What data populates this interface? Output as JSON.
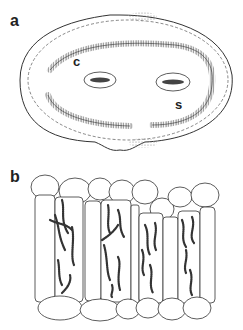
{
  "figure": {
    "panels": [
      {
        "id": "a",
        "label": "a",
        "description": "Transverse section of leaf/needle with oval outline, dashed inner boundary, two vascular bundles, and hatched cell layers",
        "annotations": [
          {
            "label": "c",
            "position": "upper-left, beside left vascular bundle"
          },
          {
            "label": "s",
            "position": "right, below right vascular bundle"
          }
        ]
      },
      {
        "id": "b",
        "label": "b",
        "description": "Enlarged section showing epidermal cells on top and bottom and elongated palisade cells containing chain-like beaded filaments"
      }
    ],
    "colors": {
      "line": "#333333",
      "stipple": "#888888",
      "background": "#ffffff"
    }
  }
}
